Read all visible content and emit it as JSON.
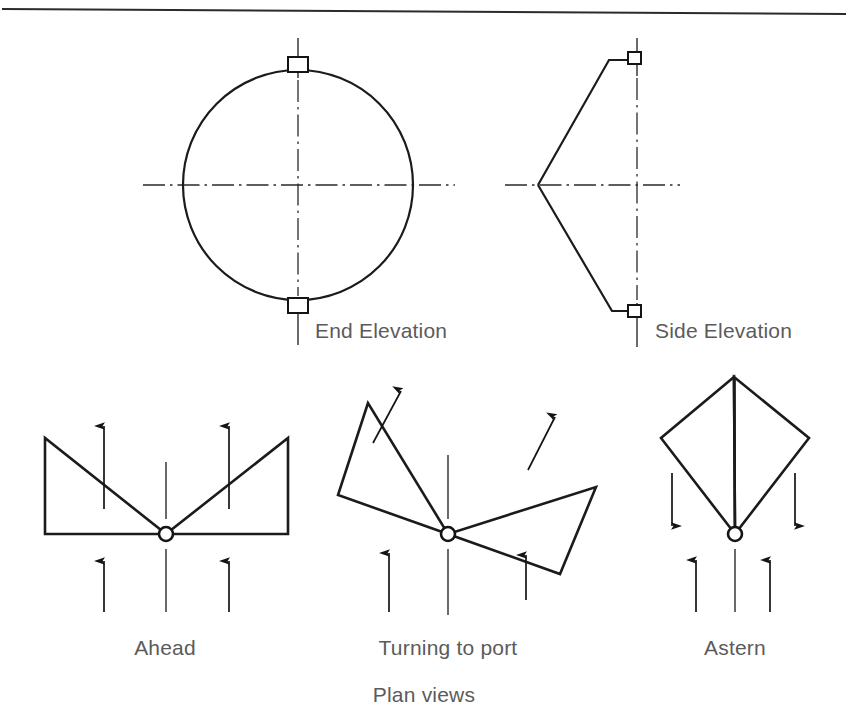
{
  "figure": {
    "caption": "Plan views",
    "top_rule": {
      "x1": 2,
      "y1": 9,
      "x2": 846,
      "y2": 14
    },
    "colors": {
      "ink": "#1b1b1b",
      "label_text": "#5b5b5b",
      "paper": "#ffffff",
      "centerline": "#2a2a2a"
    },
    "elevations": [
      {
        "id": "end-elevation",
        "label": "End Elevation",
        "label_x": 315,
        "label_y": 338,
        "shape": "circle",
        "center_x": 298,
        "center_y": 185,
        "radius": 115,
        "fittings": [
          {
            "position": "top",
            "x": 288,
            "y": 57,
            "width": 20,
            "height": 15
          },
          {
            "position": "bottom",
            "x": 288,
            "y": 298,
            "width": 20,
            "height": 15
          }
        ],
        "centerlines": {
          "vertical": {
            "x": 298,
            "y1": 38,
            "y2": 345
          },
          "horizontal": {
            "y": 185,
            "x1": 143,
            "x2": 455
          }
        }
      },
      {
        "id": "side-elevation",
        "label": "Side Elevation",
        "label_x": 655,
        "label_y": 338,
        "shape": "wedge",
        "apex_x": 538,
        "apex_y": 185,
        "top_edge_x": 609,
        "top_edge_y": 60,
        "bottom_edge_x": 612,
        "bottom_edge_y": 311,
        "right_x": 637,
        "fittings": [
          {
            "position": "top",
            "x": 628,
            "y": 54,
            "width": 13,
            "height": 12
          },
          {
            "position": "bottom",
            "x": 628,
            "y": 305,
            "width": 13,
            "height": 12
          }
        ],
        "centerlines": {
          "vertical": {
            "x": 637,
            "y1": 38,
            "y2": 347
          },
          "horizontal": {
            "y": 185,
            "x1": 505,
            "x2": 680
          }
        }
      }
    ],
    "plan_views": [
      {
        "id": "ahead",
        "label": "Ahead",
        "label_x": 165,
        "label_y": 655,
        "hub_x": 166,
        "hub_y": 534,
        "hub_radius": 7,
        "blades": [
          {
            "side": "port",
            "points": "45,438 45,534 166,534"
          },
          {
            "side": "starboard",
            "points": "288,438 288,534 166,534"
          }
        ],
        "centerline": {
          "x": 166,
          "y1": 462,
          "y2": 612
        },
        "arrows": [
          {
            "x1": 104,
            "y1": 509,
            "x2": 104,
            "y2": 424,
            "direction": "up"
          },
          {
            "x1": 229,
            "y1": 509,
            "x2": 229,
            "y2": 424,
            "direction": "up"
          },
          {
            "x1": 104,
            "y1": 612,
            "x2": 104,
            "y2": 559,
            "direction": "up"
          },
          {
            "x1": 229,
            "y1": 612,
            "x2": 229,
            "y2": 559,
            "direction": "up"
          }
        ]
      },
      {
        "id": "turning-to-port",
        "label": "Turning to port",
        "label_x": 448,
        "label_y": 655,
        "hub_x": 448,
        "hub_y": 534,
        "hub_radius": 7,
        "blades": [
          {
            "side": "port",
            "points": "368,403 338,495 448,534"
          },
          {
            "side": "starboard",
            "points": "596,487 560,574 448,534"
          }
        ],
        "centerline": {
          "x": 448,
          "y1": 455,
          "y2": 615
        },
        "arrows": [
          {
            "x1": 373,
            "y1": 443,
            "x2": 402,
            "y2": 389,
            "direction": "up-right"
          },
          {
            "x1": 528,
            "y1": 470,
            "x2": 556,
            "y2": 415,
            "direction": "up-right"
          },
          {
            "x1": 389,
            "y1": 612,
            "x2": 389,
            "y2": 551,
            "direction": "up"
          },
          {
            "x1": 526,
            "y1": 600,
            "x2": 526,
            "y2": 553,
            "direction": "up"
          }
        ]
      },
      {
        "id": "astern",
        "label": "Astern",
        "label_x": 735,
        "label_y": 655,
        "hub_x": 735,
        "hub_y": 534,
        "hub_radius": 7,
        "blades": [
          {
            "side": "port",
            "points": "734,377 661,438 735,534"
          },
          {
            "side": "starboard",
            "points": "734,377 809,438 735,534"
          }
        ],
        "centerline": {
          "x": 735,
          "y1": 380,
          "y2": 612
        },
        "arrows": [
          {
            "x1": 672,
            "y1": 473,
            "x2": 672,
            "y2": 528,
            "direction": "down"
          },
          {
            "x1": 795,
            "y1": 473,
            "x2": 795,
            "y2": 528,
            "direction": "down"
          },
          {
            "x1": 696,
            "y1": 612,
            "x2": 696,
            "y2": 558,
            "direction": "up"
          },
          {
            "x1": 770,
            "y1": 612,
            "x2": 770,
            "y2": 558,
            "direction": "up"
          }
        ]
      }
    ],
    "caption_x": 424,
    "caption_y": 702
  }
}
